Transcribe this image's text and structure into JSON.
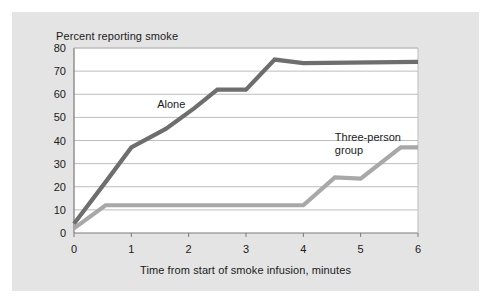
{
  "figure": {
    "background_color": "#e4e4e4",
    "plot_background_color": "#ffffff",
    "grid_color": "#bdbdbd",
    "axis_color": "#7a7a7a",
    "text_color": "#1a1a1a"
  },
  "chart_data": {
    "type": "line",
    "title": "Percent reporting smoke",
    "xlabel": "Time from start of smoke infusion, minutes",
    "ylabel": "Percent reporting smoke",
    "xlim": [
      0,
      6
    ],
    "ylim": [
      0,
      80
    ],
    "xticks": [
      "0",
      "1",
      "2",
      "3",
      "4",
      "5",
      "6"
    ],
    "yticks": [
      "0",
      "10",
      "20",
      "30",
      "40",
      "50",
      "60",
      "70",
      "80"
    ],
    "grid": true,
    "legend_position": "inline-annotation",
    "series": [
      {
        "name": "Alone",
        "color": "#6e6e6e",
        "label_x": 1.45,
        "label_y": 54,
        "x": [
          0,
          0.55,
          1.0,
          1.6,
          2.1,
          2.5,
          3.0,
          3.5,
          4.0,
          6.0
        ],
        "y": [
          4,
          22,
          37,
          45,
          54,
          62,
          62,
          75,
          73.5,
          74
        ]
      },
      {
        "name": "Three-person group",
        "color": "#a8a8a8",
        "label_x": 4.55,
        "label_y": 40,
        "label_lines": [
          "Three-person",
          "group"
        ],
        "x": [
          0,
          0.55,
          4.0,
          4.55,
          5.0,
          5.7,
          6.0
        ],
        "y": [
          2,
          12,
          12,
          24,
          23.5,
          37,
          37
        ]
      }
    ]
  },
  "annotations": {
    "alone_label": "Alone",
    "group_label_line1": "Three-person",
    "group_label_line2": "group"
  }
}
